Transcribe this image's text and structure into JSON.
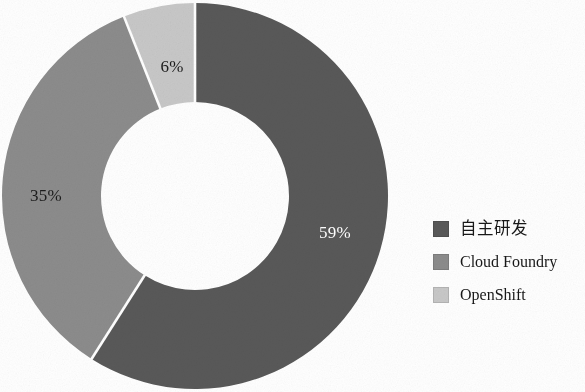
{
  "chart_data": {
    "type": "pie",
    "variant": "donut",
    "title": "",
    "subtitle": "",
    "xlabel": "",
    "ylabel": "",
    "categories": [
      "自主研发",
      "Cloud Foundry",
      "OpenShift"
    ],
    "values": [
      59,
      35,
      6
    ],
    "value_labels": [
      "59%",
      "35%",
      "6%"
    ],
    "units": "%",
    "total": 100,
    "start_angle_deg": 0,
    "direction": "clockwise",
    "inner_radius_ratio": 0.49,
    "slice_colors": [
      "#595959",
      "#8c8c8c",
      "#c8c8c8"
    ],
    "label_text_colors": [
      "#ffffff",
      "#1c1c1c",
      "#1c1c1c"
    ],
    "separator_color": "#ffffff",
    "grid": false,
    "legend": {
      "position": "right",
      "entries": [
        {
          "label": "自主研发",
          "value_label": "59%",
          "color": "#595959",
          "script": "cjk"
        },
        {
          "label": "Cloud Foundry",
          "value_label": "35%",
          "color": "#8c8c8c",
          "script": "latin"
        },
        {
          "label": "OpenShift",
          "value_label": "6%",
          "color": "#c8c8c8",
          "script": "latin"
        }
      ]
    },
    "annotations": []
  },
  "figure": {
    "background": "#ffffff",
    "donut": {
      "center_x": 195,
      "center_y": 196,
      "outer_radius": 193,
      "inner_radius": 94,
      "clipped_edges": "bottom"
    }
  }
}
